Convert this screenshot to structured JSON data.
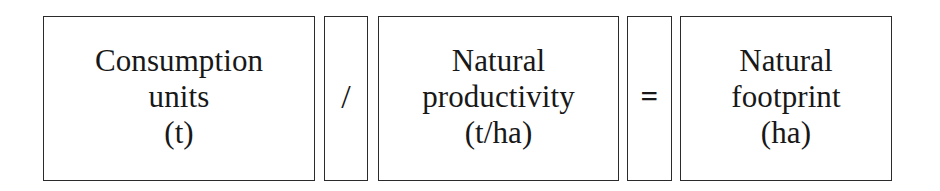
{
  "diagram": {
    "background_color": "#ffffff",
    "ink_color": "#181818",
    "border_color": "#2b2b2b",
    "elements": [
      {
        "kind": "term",
        "name": "consumption-units",
        "lines": [
          "Consumption",
          "units",
          "(t)"
        ],
        "unit": "(t)"
      },
      {
        "kind": "operator",
        "name": "division-operator",
        "glyph": "/"
      },
      {
        "kind": "term",
        "name": "natural-productivity",
        "lines": [
          "Natural",
          "productivity",
          "(t/ha)"
        ],
        "unit": "(t/ha)"
      },
      {
        "kind": "operator",
        "name": "equals-operator",
        "glyph": "="
      },
      {
        "kind": "term",
        "name": "natural-footprint",
        "lines": [
          "Natural",
          "footprint",
          "(ha)"
        ],
        "unit": "(ha)"
      }
    ]
  }
}
